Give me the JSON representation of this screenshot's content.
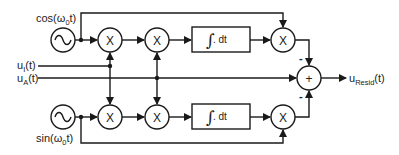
{
  "diagram": {
    "colors": {
      "stroke": "#1a1a1a",
      "background": "#ffffff",
      "text": "#222222"
    },
    "oscillators": [
      {
        "id": "cos_osc",
        "label_pre": "cos(ω",
        "label_sub": "0",
        "label_post": "t)",
        "icon": "sine-wave-icon"
      },
      {
        "id": "sin_osc",
        "label_pre": "sin(ω",
        "label_sub": "0",
        "label_post": "t)",
        "icon": "sine-wave-icon"
      }
    ],
    "inputs": [
      {
        "id": "u_i",
        "label_main": "u",
        "label_sub": "I",
        "label_post": "(t)"
      },
      {
        "id": "u_a",
        "label_main": "u",
        "label_sub": "A",
        "label_post": "(t)"
      }
    ],
    "multipliers": {
      "symbol": "X"
    },
    "integrators": {
      "integral_symbol": "∫",
      "text": ". dt"
    },
    "summer": {
      "symbol": "+",
      "sign_top": "-",
      "sign_bottom": "-"
    },
    "output": {
      "label_main": "u",
      "label_sub": "Resid",
      "label_post": "(t)"
    }
  }
}
